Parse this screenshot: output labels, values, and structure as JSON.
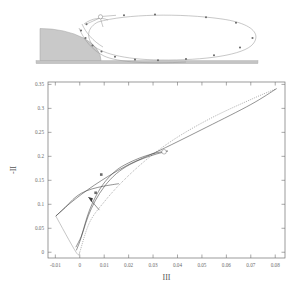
{
  "figure": {
    "name": "turbulence-anisotropy-invariant-map-with-flow-inset",
    "panels": [
      "flow-field-inset",
      "invariant-map"
    ]
  },
  "inset": {
    "name": "flow-over-bump-streamlines",
    "obstacle_label": "",
    "ground_label": "",
    "markers_note": "streamline sample points",
    "vortex_center_marker": "open-circle"
  },
  "chart_data": {
    "type": "line",
    "title": "",
    "xlabel": "III",
    "ylabel": "-II",
    "xlim": [
      -0.013,
      0.084
    ],
    "ylim": [
      -0.012,
      0.355
    ],
    "xticks": [
      -0.01,
      0,
      0.01,
      0.02,
      0.03,
      0.04,
      0.05,
      0.06,
      0.07,
      0.08
    ],
    "xticklabels": [
      "-0.01",
      "0",
      "0.01",
      "0.02",
      "0.03",
      "0.04",
      "0.05",
      "0.06",
      "0.07",
      "0.08"
    ],
    "yticks": [
      0,
      0.05,
      0.1,
      0.15,
      0.2,
      0.25,
      0.3,
      0.35
    ],
    "yticklabels": [
      "0",
      "0.05",
      "0.1",
      "0.15",
      "0.2",
      "0.25",
      "0.3",
      "0.35"
    ],
    "grid": false,
    "legend": null,
    "series": [
      {
        "name": "two-component-boundary",
        "style": "solid-light",
        "points": [
          [
            -0.0098,
            0.0755
          ],
          [
            -0.0015,
            0.0
          ],
          [
            0.0,
            0.0
          ]
        ]
      },
      {
        "name": "axisymmetric-expansion-boundary",
        "style": "dotted",
        "points": [
          [
            0.0,
            0.0
          ],
          [
            0.004,
            0.062
          ],
          [
            0.01,
            0.105
          ],
          [
            0.018,
            0.15
          ],
          [
            0.028,
            0.196
          ],
          [
            0.04,
            0.24
          ],
          [
            0.055,
            0.283
          ],
          [
            0.072,
            0.323
          ],
          [
            0.0805,
            0.341
          ]
        ]
      },
      {
        "name": "axisymmetric-contraction-boundary",
        "style": "solid",
        "points": [
          [
            -0.0098,
            0.0755
          ],
          [
            -0.004,
            0.102
          ],
          [
            0.006,
            0.14
          ],
          [
            0.019,
            0.18
          ],
          [
            0.033,
            0.213
          ],
          [
            0.052,
            0.261
          ],
          [
            0.07,
            0.308
          ],
          [
            0.0805,
            0.341
          ]
        ]
      },
      {
        "name": "trajectory-upper",
        "style": "solid",
        "points": [
          [
            -0.0016,
            0.0105
          ],
          [
            0.0006,
            0.033
          ],
          [
            0.0022,
            0.06
          ],
          [
            0.004,
            0.088
          ],
          [
            0.0068,
            0.119
          ],
          [
            0.0105,
            0.148
          ],
          [
            0.0155,
            0.173
          ],
          [
            0.0215,
            0.19
          ],
          [
            0.027,
            0.201
          ],
          [
            0.032,
            0.208
          ],
          [
            0.036,
            0.211
          ]
        ]
      },
      {
        "name": "trajectory-lower",
        "style": "solid",
        "points": [
          [
            -0.0014,
            0.004
          ],
          [
            0.0,
            0.022
          ],
          [
            0.0016,
            0.047
          ],
          [
            0.0035,
            0.076
          ],
          [
            0.0063,
            0.107
          ],
          [
            0.0102,
            0.138
          ],
          [
            0.015,
            0.164
          ],
          [
            0.0205,
            0.183
          ],
          [
            0.0262,
            0.196
          ],
          [
            0.0315,
            0.205
          ],
          [
            0.036,
            0.211
          ]
        ]
      },
      {
        "name": "trajectory-return-fan",
        "style": "solid",
        "points": [
          [
            -0.0098,
            0.0755
          ],
          [
            -0.006,
            0.093
          ],
          [
            -0.0028,
            0.11
          ],
          [
            0.0006,
            0.123
          ],
          [
            0.005,
            0.132
          ],
          [
            0.01,
            0.138
          ],
          [
            0.016,
            0.143
          ]
        ]
      }
    ],
    "markers": [
      {
        "x": 0.0345,
        "y": 0.2095,
        "type": "open-circle",
        "label": ""
      },
      {
        "x": 0.0088,
        "y": 0.162,
        "type": "filled-square",
        "label": ""
      },
      {
        "x": 0.0065,
        "y": 0.124,
        "type": "filled-square",
        "label": ""
      }
    ],
    "annotations": [
      {
        "type": "arrow",
        "x": 0.0035,
        "y": 0.115,
        "note": "flow direction arrow"
      }
    ]
  }
}
